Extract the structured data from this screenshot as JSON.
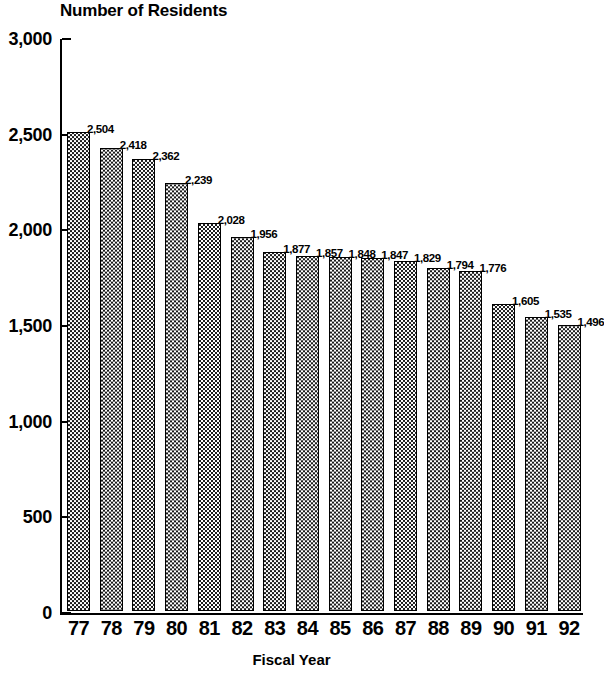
{
  "chart_data": {
    "type": "bar",
    "title": "Number of Residents",
    "xlabel": "Fiscal Year",
    "ylabel": "",
    "ylim": [
      0,
      3000
    ],
    "ytick_labels": [
      "3,000",
      "2,500",
      "2,000",
      "1,500",
      "1,000",
      "500",
      "0"
    ],
    "ytick_values": [
      3000,
      2500,
      2000,
      1500,
      1000,
      500,
      0
    ],
    "grid": false,
    "legend": null,
    "categories": [
      "77",
      "78",
      "79",
      "80",
      "81",
      "82",
      "83",
      "84",
      "85",
      "86",
      "87",
      "88",
      "89",
      "90",
      "91",
      "92"
    ],
    "values": [
      2504,
      2418,
      2362,
      2239,
      2028,
      1956,
      1877,
      1857,
      1848,
      1847,
      1829,
      1794,
      1776,
      1605,
      1535,
      1496
    ],
    "value_labels": [
      "2,504",
      "2,418",
      "2,362",
      "2,239",
      "2,028",
      "1,956",
      "1,877",
      "1,857",
      "1,848",
      "1,847",
      "1,829",
      "1,794",
      "1,776",
      "1,605",
      "1,535",
      "1,496"
    ],
    "bar_fill": "#1a1a1a",
    "bar_border": "#000000",
    "background": "#ffffff"
  }
}
